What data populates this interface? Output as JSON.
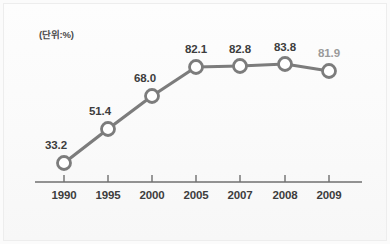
{
  "chart_data": {
    "type": "line",
    "title": "",
    "subtitle": "",
    "unit_note": "(단위:%)",
    "xlabel": "",
    "ylabel": "",
    "grid": false,
    "legend": false,
    "legend_position": "none",
    "categories": [
      "1990",
      "1995",
      "2000",
      "2005",
      "2007",
      "2008",
      "2009"
    ],
    "x": [
      1990,
      1995,
      2000,
      2005,
      2007,
      2008,
      2009
    ],
    "values": [
      33.2,
      51.4,
      68.0,
      82.1,
      82.8,
      83.8,
      81.9
    ],
    "point_labels": [
      "33.2",
      "51.4",
      "68.0",
      "82.1",
      "82.8",
      "83.8",
      "81.9"
    ],
    "ylim": [
      25,
      90
    ],
    "xlim": [
      0,
      6
    ],
    "series": [
      {
        "name": "",
        "values": [
          33.2,
          51.4,
          68.0,
          82.1,
          82.8,
          83.8,
          81.9
        ],
        "line_color": "#7c7c7c",
        "marker_fill": "#ffffff",
        "marker_stroke": "#7c7c7c"
      }
    ],
    "axis_color": "#6f6f6f",
    "label_color": "#3d3d3d",
    "muted_label_color": "#9a9a9a",
    "muted_label_index": 6,
    "background_color": "#fbfbfb"
  },
  "geometry": {
    "point_px": [
      {
        "x": 64,
        "y": 163,
        "label_x": 56,
        "label_y": 139
      },
      {
        "x": 108,
        "y": 129,
        "label_x": 100,
        "label_y": 105
      },
      {
        "x": 152,
        "y": 96,
        "label_x": 145,
        "label_y": 72
      },
      {
        "x": 196,
        "y": 67,
        "label_x": 196,
        "label_y": 43
      },
      {
        "x": 240,
        "y": 66,
        "label_x": 240,
        "label_y": 43
      },
      {
        "x": 285,
        "y": 64,
        "label_x": 285,
        "label_y": 41
      },
      {
        "x": 329,
        "y": 71,
        "label_x": 329,
        "label_y": 47
      }
    ],
    "axis_y": 182,
    "axis_x_start": 35,
    "axis_x_end": 362,
    "tick_length": 7,
    "tick_label_y": 189,
    "marker_radius": 6.5
  }
}
